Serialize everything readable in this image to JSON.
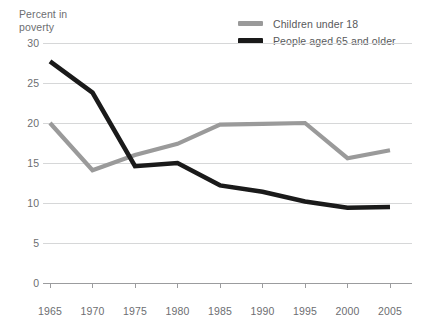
{
  "axis_title": "Percent in\npoverty",
  "legend": {
    "position": "top-right",
    "entries": [
      {
        "label": "Children under 18",
        "color": "#9a9a9a",
        "swatch": "line-swatch"
      },
      {
        "label": "People aged 65 and older",
        "color": "#1a1a1a",
        "swatch": "line-swatch"
      }
    ]
  },
  "chart_data": {
    "type": "line",
    "title": "",
    "subtitle": "",
    "xlabel": "",
    "ylabel": "Percent in poverty",
    "x": [
      1965,
      1970,
      1975,
      1980,
      1985,
      1990,
      1995,
      2000,
      2005
    ],
    "xtick_labels": [
      "1965",
      "1970",
      "1975",
      "1980",
      "1985",
      "1990",
      "1995",
      "2000",
      "2005"
    ],
    "ytick_labels": [
      "0",
      "5",
      "10",
      "15",
      "20",
      "25",
      "30"
    ],
    "ytick_values": [
      0,
      5,
      10,
      15,
      20,
      25,
      30
    ],
    "xlim": [
      1965,
      2005
    ],
    "ylim": [
      0,
      30
    ],
    "grid": "horizontal",
    "series": [
      {
        "name": "Children under 18",
        "color": "#9a9a9a",
        "values": [
          20.0,
          14.1,
          16.0,
          17.4,
          19.8,
          19.9,
          20.0,
          15.6,
          16.6
        ]
      },
      {
        "name": "People aged 65 and older",
        "color": "#1a1a1a",
        "values": [
          27.7,
          23.8,
          14.6,
          15.0,
          12.2,
          11.4,
          10.2,
          9.4,
          9.5
        ]
      }
    ]
  },
  "colors": {
    "gridline": "#d6d7d8",
    "axis": "#9b9c9e",
    "text": "#6d6e71",
    "children_line": "#9a9a9a",
    "elderly_line": "#1a1a1a"
  }
}
